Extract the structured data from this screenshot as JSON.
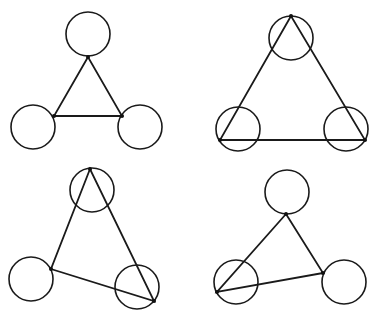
{
  "diagram": {
    "panels": [
      {
        "id": "top-left",
        "circles": [
          {
            "cx": 88,
            "cy": 34,
            "r": 22
          },
          {
            "cx": 33,
            "cy": 127,
            "r": 22
          },
          {
            "cx": 140,
            "cy": 127,
            "r": 22
          }
        ],
        "vertices": [
          [
            88,
            57
          ],
          [
            54,
            116
          ],
          [
            122,
            116
          ]
        ]
      },
      {
        "id": "top-right",
        "circles": [
          {
            "cx": 291,
            "cy": 38,
            "r": 22
          },
          {
            "cx": 238,
            "cy": 129,
            "r": 22
          },
          {
            "cx": 346,
            "cy": 129,
            "r": 22
          }
        ],
        "vertices": [
          [
            291,
            16
          ],
          [
            220,
            140
          ],
          [
            365,
            140
          ]
        ]
      },
      {
        "id": "bottom-left",
        "circles": [
          {
            "cx": 92,
            "cy": 190,
            "r": 22
          },
          {
            "cx": 31,
            "cy": 279,
            "r": 22
          },
          {
            "cx": 137,
            "cy": 287,
            "r": 22
          }
        ],
        "vertices": [
          [
            90,
            169
          ],
          [
            51,
            269
          ],
          [
            154,
            301
          ]
        ]
      },
      {
        "id": "bottom-right",
        "circles": [
          {
            "cx": 287,
            "cy": 192,
            "r": 22
          },
          {
            "cx": 236,
            "cy": 282,
            "r": 22
          },
          {
            "cx": 344,
            "cy": 282,
            "r": 22
          }
        ],
        "vertices": [
          [
            286,
            214
          ],
          [
            217,
            292
          ],
          [
            323,
            273
          ]
        ]
      }
    ]
  }
}
